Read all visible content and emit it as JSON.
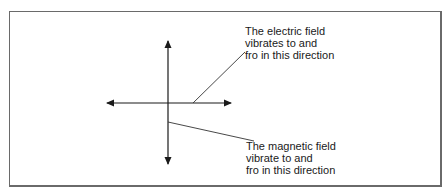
{
  "diagram": {
    "type": "electromagnetic-wave-polarization",
    "colors": {
      "line": "#1a1a1a",
      "frame": "#6a6a6a",
      "background": "#ffffff"
    },
    "electric_field_label": {
      "lines": [
        "The electric field",
        "vibrates to and",
        "fro in this direction"
      ]
    },
    "magnetic_field_label": {
      "lines": [
        "The magnetic field",
        "vibrate to and",
        "fro in this direction"
      ]
    },
    "axes": {
      "horizontal": {
        "description": "double-headed arrow (electric field direction)",
        "x1": 107,
        "x2": 231,
        "y": 103
      },
      "vertical": {
        "description": "double-headed arrow (magnetic field direction)",
        "x": 168,
        "y1": 41,
        "y2": 164
      }
    },
    "leaders": {
      "electric": {
        "from": [
          193,
          103
        ],
        "to": [
          245,
          52
        ]
      },
      "magnetic": {
        "from": [
          168,
          122
        ],
        "to": [
          254,
          141
        ]
      }
    }
  }
}
